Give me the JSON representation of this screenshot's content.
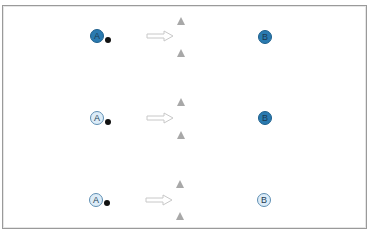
{
  "diagram": {
    "rows": [
      {
        "source": {
          "label": "A",
          "state": "filled",
          "color": "#2a7ab0"
        },
        "target": {
          "label": "B",
          "state": "filled",
          "color": "#2a7ab0"
        }
      },
      {
        "source": {
          "label": "A",
          "state": "light",
          "color": "#dcecf8"
        },
        "target": {
          "label": "B",
          "state": "filled",
          "color": "#2a7ab0"
        }
      },
      {
        "source": {
          "label": "A",
          "state": "light",
          "color": "#dcecf8"
        },
        "target": {
          "label": "B",
          "state": "light",
          "color": "#dcecf8"
        }
      }
    ],
    "icons": {
      "ball": "black-dot",
      "arrow": "hollow-right-arrow",
      "cones": "gray-triangle"
    },
    "colors": {
      "dark_node": "#2a7ab0",
      "light_node": "#dcecf8",
      "cone": "#a8a8a8",
      "ball": "#111111",
      "arrow_outline": "#c8c8c8",
      "frame": "#9a9a9a"
    }
  }
}
